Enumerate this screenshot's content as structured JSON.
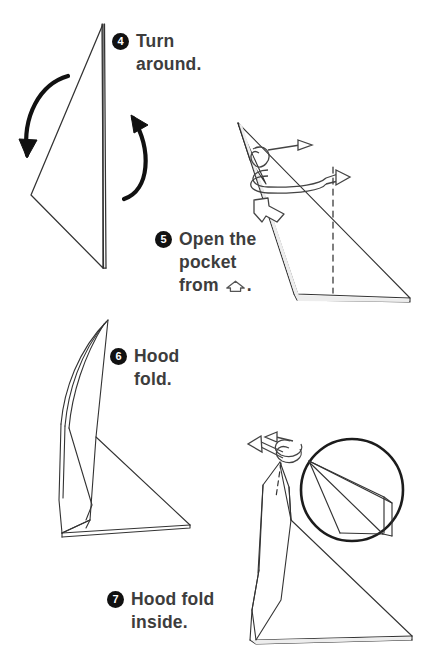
{
  "page": {
    "background_color": "#ffffff",
    "ink_color": "#333333",
    "text_color": "#3d3d3d",
    "bullet_color": "#111111",
    "width": 430,
    "height": 656
  },
  "steps": [
    {
      "number": "4",
      "text": "Turn\naround.",
      "icon": "numbered-bullet-4",
      "diagram": "turn-around-diagram"
    },
    {
      "number": "5",
      "text_before": "Open the\npocket\nfrom ",
      "text_after": ".",
      "text": "Open the\npocket\nfrom ⌂.",
      "pocket_symbol": "open-pocket-arrow-icon",
      "icon": "numbered-bullet-5",
      "diagram": "open-pocket-diagram"
    },
    {
      "number": "6",
      "text": "Hood\nfold.",
      "icon": "numbered-bullet-6",
      "diagram": "hood-fold-diagram"
    },
    {
      "number": "7",
      "text": "Hood fold\ninside.",
      "icon": "numbered-bullet-7",
      "diagram": "hood-fold-inside-diagram"
    }
  ]
}
